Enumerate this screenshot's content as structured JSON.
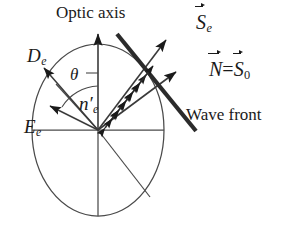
{
  "figure": {
    "kind": "optics-diagram",
    "background_color": "#ffffff",
    "stroke_color": "#1a1a1a"
  },
  "labels": {
    "optic_axis": "Optic axis",
    "poynting_extraordinary": "S",
    "poynting_extraordinary_sub": "e",
    "normal": "N",
    "equals": "=",
    "poynting_ordinary": "S",
    "poynting_ordinary_sub": "0",
    "wave_front": "Wave front",
    "displacement": "D",
    "displacement_sub": "e",
    "theta": "θ",
    "refractive_index": "n",
    "refractive_index_prime": "′",
    "refractive_index_sub": "e",
    "electric_field": "E",
    "electric_field_sub": "e"
  },
  "geometry": {
    "ellipse": {
      "cx": 98,
      "cy": 130,
      "rx": 66,
      "ry": 86
    },
    "center": {
      "x": 98,
      "y": 130
    },
    "optic_axis_arrow": {
      "x1": 98,
      "y1": 216,
      "x2": 98,
      "y2": 32
    },
    "horizontal_axis": {
      "x1": 32,
      "y1": 130,
      "x2": 164,
      "y2": 130
    },
    "vector_se": {
      "x1": 98,
      "y1": 130,
      "x2": 168,
      "y2": 37
    },
    "vector_n": {
      "x1": 98,
      "y1": 130,
      "x2": 178,
      "y2": 70
    },
    "vector_de": {
      "x1": 98,
      "y1": 130,
      "x2": 42,
      "y2": 65
    },
    "vector_ee": {
      "x1": 98,
      "y1": 130,
      "x2": 47,
      "y2": 104
    },
    "ray_lower_right": {
      "x1": 98,
      "y1": 130,
      "x2": 150,
      "y2": 197
    },
    "wave_front_line": {
      "x1": 117,
      "y1": 34,
      "x2": 196,
      "y2": 131,
      "thickness": 4.2
    },
    "theta_arc_radius": 44,
    "theta_tick": {
      "x1": 88,
      "y1": 73,
      "x2": 98,
      "y2": 73
    },
    "polarization_arrows": {
      "count": 6,
      "direction_deg": -53,
      "half_length": 11,
      "along_ray_positions": [
        22,
        33,
        44,
        55,
        66,
        77
      ]
    }
  }
}
